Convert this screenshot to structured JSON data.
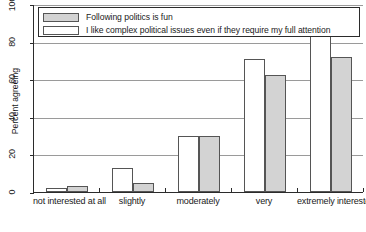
{
  "chart_data": {
    "type": "bar",
    "title": "",
    "xlabel": "",
    "ylabel": "Percent agreeing",
    "ylim": [
      0,
      100
    ],
    "yticks": [
      0,
      20,
      40,
      60,
      80,
      100
    ],
    "grid": true,
    "legend_position": "top-left-inside",
    "categories": [
      "not interested at all",
      "slightly",
      "moderately",
      "very",
      "extremely interested"
    ],
    "series": [
      {
        "name": "I like complex political issues even if they require my full attention",
        "color": "#ffffff",
        "values": [
          2,
          13,
          30,
          71,
          84
        ]
      },
      {
        "name": "Following politics is fun",
        "color": "#d3d3d3",
        "values": [
          3,
          5,
          30,
          62,
          72
        ]
      }
    ]
  },
  "legend": {
    "entries": [
      {
        "swatch": "gray",
        "label": "Following politics is fun"
      },
      {
        "swatch": "white",
        "label": "I like complex political issues even if they require my full attention"
      }
    ]
  },
  "axes": {
    "y_title": "Percent agreeing",
    "y_tick_labels": [
      "0",
      "20",
      "40",
      "60",
      "80",
      "100"
    ],
    "x_tick_labels": [
      "not interested at all",
      "slightly",
      "moderately",
      "very",
      "extremely interested"
    ]
  }
}
